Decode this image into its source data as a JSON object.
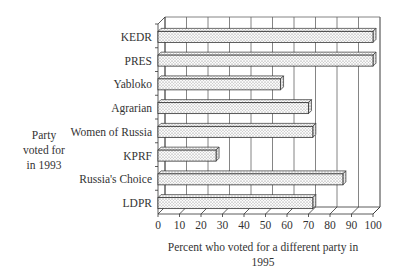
{
  "chart_data": {
    "type": "bar",
    "orientation": "horizontal",
    "style": "3d-bar",
    "title": "",
    "categories": [
      "KEDR",
      "PRES",
      "Yabloko",
      "Agrarian",
      "Women of Russia",
      "KPRF",
      "Russia's Choice",
      "LDPR"
    ],
    "values": [
      100,
      100,
      57,
      70,
      72,
      27,
      86,
      72
    ],
    "ylabel_lines": [
      "Party",
      "voted for",
      "in 1993"
    ],
    "ylabel": "Party voted for in 1993",
    "xlabel_lines": [
      "Percent who voted for a different party in",
      "1995"
    ],
    "xlabel": "Percent who voted for a different party in 1995",
    "xticks": [
      0,
      10,
      20,
      30,
      40,
      50,
      60,
      70,
      80,
      90,
      100
    ],
    "xlim": [
      0,
      100
    ],
    "grid": true,
    "legend": null,
    "bar_fill": "dotted pattern",
    "colors": {
      "ink": "#333333",
      "bar_fill": "#f4f4f4",
      "grid": "#666666"
    }
  }
}
